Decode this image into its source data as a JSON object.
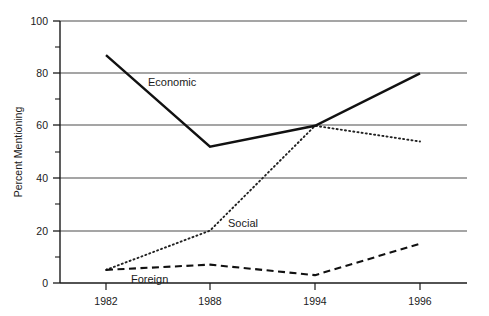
{
  "chart_data": {
    "type": "line",
    "title": "",
    "subtitle": "",
    "xlabel": "",
    "ylabel": "Percent Mentioning",
    "categories": [
      "1982",
      "1988",
      "1994",
      "1996"
    ],
    "ylim": [
      0,
      100
    ],
    "y_ticks_major": [
      "0",
      "20",
      "40",
      "60",
      "80",
      "100"
    ],
    "y_ticks_minor": [
      "10",
      "30",
      "50",
      "70",
      "90"
    ],
    "grid": "horizontal-major-only",
    "legend": "inline-labels",
    "series": [
      {
        "name": "Economic",
        "style": "solid",
        "label_text": "Economic",
        "values": [
          87,
          52,
          60,
          80
        ]
      },
      {
        "name": "Social",
        "style": "dotted",
        "label_text": "Social",
        "values": [
          5,
          20,
          60,
          54
        ]
      },
      {
        "name": "Foreign",
        "style": "dashed",
        "label_text": "Foreign",
        "values": [
          5,
          7,
          3,
          15
        ]
      }
    ],
    "annotations": [
      {
        "text": "Economic",
        "series": "Economic"
      },
      {
        "text": "Social",
        "series": "Social"
      },
      {
        "text": "Foreign",
        "series": "Foreign"
      }
    ]
  },
  "colors": {
    "axis": "#1a1a1a",
    "grid": "#4d4d4d",
    "economic": "#111111",
    "social": "#222222",
    "foreign": "#111111",
    "background": "#ffffff"
  }
}
